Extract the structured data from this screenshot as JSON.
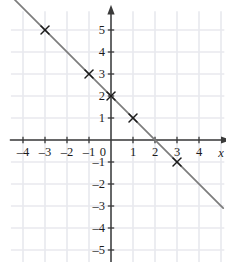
{
  "figure": {
    "kind": "coordinate-plane-line-graph",
    "width": 226,
    "height": 278,
    "background_color": "#ffffff"
  },
  "axes": {
    "x_label": "x",
    "y_label": "",
    "x_tick_labels": [
      "–4",
      "–3",
      "–2",
      "–1",
      "1",
      "2",
      "3",
      "4"
    ],
    "x_tick_values": [
      -4,
      -3,
      -2,
      -1,
      1,
      2,
      3,
      4
    ],
    "y_tick_labels": [
      "5",
      "4",
      "3",
      "2",
      "1",
      "–1",
      "–2",
      "–3",
      "–4",
      "–5"
    ],
    "y_tick_values": [
      5,
      4,
      3,
      2,
      1,
      -1,
      -2,
      -3,
      -4,
      -5
    ],
    "origin_label": "0",
    "xlim": [
      -4.6,
      5.2
    ],
    "ylim": [
      -5.6,
      5.9
    ],
    "axis_color": "#3a3a3a",
    "grid_color": "#e8e9ee",
    "grid_visible": true,
    "arrowheads": [
      "x-positive",
      "y-positive"
    ]
  },
  "chart_data": {
    "type": "line",
    "title": "",
    "xlabel": "x",
    "ylabel": "",
    "xlim": [
      -4.6,
      5.2
    ],
    "ylim": [
      -5.6,
      5.9
    ],
    "grid": true,
    "legend": "none",
    "series": [
      {
        "name": "y = -x + 2",
        "equation": "y = –x + 2",
        "slope": -1,
        "y_intercept": 2,
        "x_intercept": 2,
        "line_color": "#7d7d7d",
        "x": [
          -4.4,
          5.1
        ],
        "y": [
          6.4,
          -3.1
        ],
        "marker": "x-cross",
        "marker_color": "#1b1b1b",
        "points": [
          {
            "x": -3,
            "y": 5
          },
          {
            "x": -1,
            "y": 3
          },
          {
            "x": 0,
            "y": 2
          },
          {
            "x": 1,
            "y": 1
          },
          {
            "x": 3,
            "y": -1
          }
        ]
      }
    ]
  }
}
